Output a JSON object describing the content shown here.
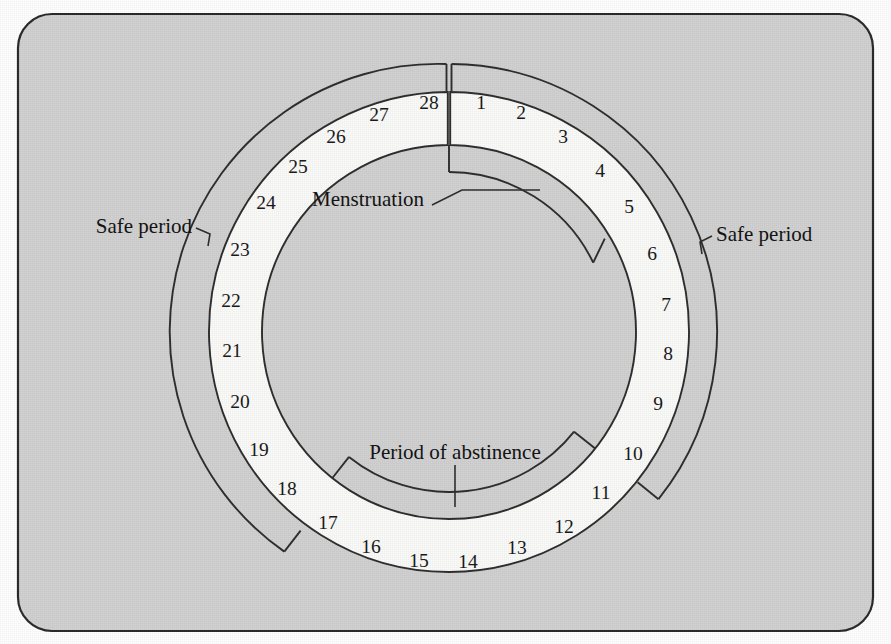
{
  "figure": {
    "background_color": "#d2d2d2",
    "panel_border_color": "#2b2b2b",
    "band_fill_color": "#fbfbf9",
    "line_color": "#2f2f2f",
    "text_color": "#1a1a1a"
  },
  "chart_data": {
    "type": "pie",
    "title": "",
    "subtitle": "",
    "xlabel": "",
    "ylabel": "",
    "legend_position": "none",
    "grid": false,
    "cycle_length": 28,
    "start_angle_deg": -90,
    "direction": "clockwise",
    "categories": [
      "1",
      "2",
      "3",
      "4",
      "5",
      "6",
      "7",
      "8",
      "9",
      "10",
      "11",
      "12",
      "13",
      "14",
      "15",
      "16",
      "17",
      "18",
      "19",
      "20",
      "21",
      "22",
      "23",
      "24",
      "25",
      "26",
      "27",
      "28"
    ],
    "values": [
      1,
      1,
      1,
      1,
      1,
      1,
      1,
      1,
      1,
      1,
      1,
      1,
      1,
      1,
      1,
      1,
      1,
      1,
      1,
      1,
      1,
      1,
      1,
      1,
      1,
      1,
      1,
      1
    ],
    "day_numbers": [
      "1",
      "2",
      "3",
      "4",
      "5",
      "6",
      "7",
      "8",
      "9",
      "10",
      "11",
      "12",
      "13",
      "14",
      "15",
      "16",
      "17",
      "18",
      "19",
      "20",
      "21",
      "22",
      "23",
      "24",
      "25",
      "26",
      "27",
      "28"
    ],
    "phases": [
      {
        "name": "Menstruation",
        "label": "Menstruation",
        "days": [
          1,
          2,
          3,
          4,
          5
        ],
        "start_day": 1,
        "end_day": 5,
        "bracket_side": "inner",
        "label_anchor": "end"
      },
      {
        "name": "Period of abstinence",
        "label": "Period of abstinence",
        "days": [
          11,
          12,
          13,
          14,
          15,
          16,
          17
        ],
        "start_day": 11,
        "end_day": 17,
        "bracket_side": "inner",
        "label_anchor": "middle"
      },
      {
        "name": "Safe period (right)",
        "label": "Safe period",
        "days": [
          1,
          2,
          3,
          4,
          5,
          6,
          7,
          8,
          9,
          10
        ],
        "start_day": 1,
        "end_day": 10,
        "bracket_side": "outer",
        "label_anchor": "start"
      },
      {
        "name": "Safe period (left)",
        "label": "Safe period",
        "days": [
          18,
          19,
          20,
          21,
          22,
          23,
          24,
          25,
          26,
          27,
          28
        ],
        "start_day": 18,
        "end_day": 28,
        "bracket_side": "outer",
        "label_anchor": "end"
      }
    ]
  },
  "labels": {
    "menstruation": "Menstruation",
    "period_of_abstinence": "Period of abstinence",
    "safe_period_left": "Safe period",
    "safe_period_right": "Safe period"
  },
  "days": [
    {
      "n": "1",
      "x": 481,
      "y": 105
    },
    {
      "n": "2",
      "x": 521,
      "y": 115
    },
    {
      "n": "3",
      "x": 563,
      "y": 139
    },
    {
      "n": "4",
      "x": 600,
      "y": 173
    },
    {
      "n": "5",
      "x": 629,
      "y": 209
    },
    {
      "n": "6",
      "x": 652,
      "y": 256
    },
    {
      "n": "7",
      "x": 666,
      "y": 307
    },
    {
      "n": "8",
      "x": 668,
      "y": 356
    },
    {
      "n": "9",
      "x": 658,
      "y": 406
    },
    {
      "n": "10",
      "x": 633,
      "y": 456
    },
    {
      "n": "11",
      "x": 601,
      "y": 495
    },
    {
      "n": "12",
      "x": 564,
      "y": 529
    },
    {
      "n": "13",
      "x": 517,
      "y": 550
    },
    {
      "n": "14",
      "x": 468,
      "y": 564
    },
    {
      "n": "15",
      "x": 419,
      "y": 563
    },
    {
      "n": "16",
      "x": 371,
      "y": 549
    },
    {
      "n": "17",
      "x": 328,
      "y": 525
    },
    {
      "n": "18",
      "x": 287,
      "y": 491
    },
    {
      "n": "19",
      "x": 259,
      "y": 452
    },
    {
      "n": "20",
      "x": 240,
      "y": 404
    },
    {
      "n": "21",
      "x": 232,
      "y": 353
    },
    {
      "n": "22",
      "x": 231,
      "y": 303
    },
    {
      "n": "23",
      "x": 240,
      "y": 252
    },
    {
      "n": "24",
      "x": 266,
      "y": 205
    },
    {
      "n": "25",
      "x": 298,
      "y": 169
    },
    {
      "n": "26",
      "x": 336,
      "y": 139
    },
    {
      "n": "27",
      "x": 379,
      "y": 117
    },
    {
      "n": "28",
      "x": 429,
      "y": 105
    }
  ],
  "annotations": [
    {
      "id": "menstruation",
      "text": "Menstruation",
      "x": 424,
      "y": 201,
      "anchor": "end",
      "leader": "M 432 205 L 462 190 L 540 190"
    },
    {
      "id": "period-of-abstinence",
      "text": "Period of abstinence",
      "x": 455,
      "y": 454,
      "anchor": "middle",
      "leader": "M 455 465 L 455 507"
    },
    {
      "id": "safe-period-left",
      "text": "Safe period",
      "x": 192,
      "y": 228,
      "anchor": "end",
      "leader": "M 196 228 L 210 234 L 208 246"
    },
    {
      "id": "safe-period-right",
      "text": "Safe period",
      "x": 716,
      "y": 236,
      "anchor": "start",
      "leader": "M 712 236 L 700 242 L 702 254"
    }
  ],
  "geometry": {
    "center_x": 449,
    "center_y": 332,
    "band_outer_radius": 240,
    "band_inner_radius": 187,
    "safe_bracket_radius": 268,
    "phase_bracket_radius": 160,
    "cap_length": 27
  }
}
